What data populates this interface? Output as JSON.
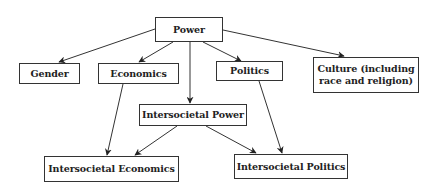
{
  "diagram": {
    "type": "hierarchy",
    "nodes": {
      "power": "Power",
      "gender": "Gender",
      "economics": "Economics",
      "politics": "Politics",
      "culture_line1": "Culture (including",
      "culture_line2": "race and religion)",
      "intersocietal_power": "Intersocietal Power",
      "intersocietal_economics": "Intersocietal Economics",
      "intersocietal_politics": "Intersocietal Politics"
    },
    "edges": [
      {
        "from": "Power",
        "to": "Gender"
      },
      {
        "from": "Power",
        "to": "Economics"
      },
      {
        "from": "Power",
        "to": "Intersocietal Power"
      },
      {
        "from": "Power",
        "to": "Politics"
      },
      {
        "from": "Power",
        "to": "Culture (including race and religion)"
      },
      {
        "from": "Economics",
        "to": "Intersocietal Economics"
      },
      {
        "from": "Politics",
        "to": "Intersocietal Politics"
      },
      {
        "from": "Intersocietal Power",
        "to": "Intersocietal Economics"
      },
      {
        "from": "Intersocietal Power",
        "to": "Intersocietal Politics"
      }
    ],
    "colors": {
      "stroke": "#333333",
      "text": "#222222",
      "background": "#ffffff"
    }
  }
}
